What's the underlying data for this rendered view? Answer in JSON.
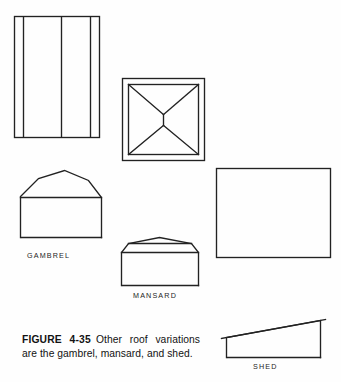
{
  "figure": {
    "number_label": "FIGURE 4-35",
    "caption_text": "Other roof variations are the gambrel, mansard, and shed.",
    "full_caption": "FIGURE 4-35 Other roof variations are the gambrel, mansard, and shed."
  },
  "drawings": [
    {
      "id": "gambrel-plan",
      "name": "gambrel-roof-plan-view",
      "type": "plan",
      "roof": "gambrel",
      "description": "Rectangle with two vertical ridge lines dividing the roof plan"
    },
    {
      "id": "mansard-plan",
      "name": "mansard-roof-plan-view",
      "type": "plan",
      "roof": "mansard",
      "description": "Double rectangle with hip lines forming an X and a short central ridge"
    },
    {
      "id": "shed-plan",
      "name": "shed-roof-plan-view",
      "type": "plan",
      "roof": "shed",
      "description": "Plain rectangle representing a single sloping roof plane"
    },
    {
      "id": "gambrel-elevation",
      "name": "gambrel-roof-elevation-view",
      "type": "elevation",
      "roof": "gambrel",
      "description": "Peaked roof with a break in each slope over a rectangular wall"
    },
    {
      "id": "mansard-elevation",
      "name": "mansard-roof-elevation-view",
      "type": "elevation",
      "roof": "mansard",
      "description": "Shallow top peak with steep flaring lower slopes over a rectangular wall"
    },
    {
      "id": "shed-elevation",
      "name": "shed-roof-elevation-view",
      "type": "elevation",
      "roof": "shed",
      "description": "Single plane sloping up to the right over a rectangular wall"
    }
  ],
  "labels": {
    "gambrel": "GAMBREL",
    "mansard": "MANSARD",
    "shed": "SHED"
  },
  "colors": {
    "background": "#fefefe",
    "ink": "#1a1a1a",
    "line": "#222222"
  }
}
